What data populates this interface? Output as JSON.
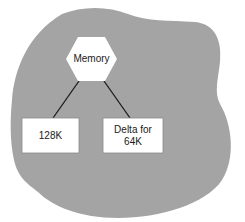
{
  "diagram": {
    "type": "tree",
    "background_blob_color": "#a4a4a4",
    "node_fill": "#ffffff",
    "line_color": "#1a1a1a",
    "root": {
      "id": "memory",
      "shape": "hexagon",
      "label": "Memory"
    },
    "children": [
      {
        "id": "128k",
        "shape": "rectangle",
        "label": "128K"
      },
      {
        "id": "delta-64k",
        "shape": "rectangle",
        "label": "Delta for\n64K"
      }
    ],
    "edges": [
      {
        "from": "memory",
        "to": "128k"
      },
      {
        "from": "memory",
        "to": "delta-64k"
      }
    ]
  }
}
